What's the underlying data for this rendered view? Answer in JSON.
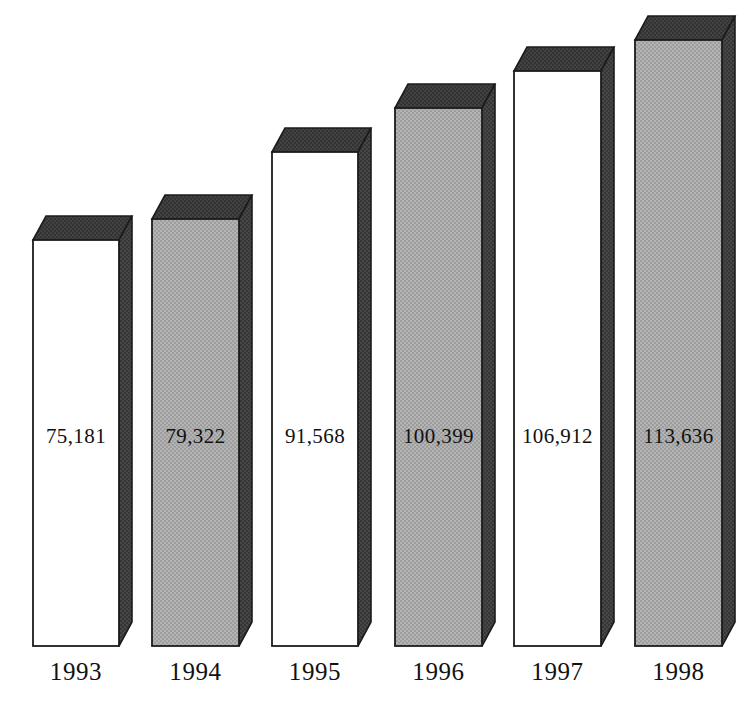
{
  "chart_data": {
    "type": "bar",
    "title": "",
    "subtitle": "",
    "xlabel": "",
    "ylabel": "",
    "categories": [
      "1993",
      "1994",
      "1995",
      "1996",
      "1997",
      "1998"
    ],
    "values": [
      75181,
      79322,
      91568,
      100399,
      106912,
      113636
    ],
    "value_labels": [
      "75,181",
      "79,322",
      "91,568",
      "100,399",
      "106,912",
      "113,636"
    ],
    "series": [
      {
        "name": "",
        "values": [
          75181,
          79322,
          91568,
          100399,
          106912,
          113636
        ]
      }
    ],
    "ylim": [
      0,
      122000
    ],
    "grid": false,
    "legend": false,
    "legend_position": "none",
    "style": "3d-extruded-columns",
    "bar_fills": [
      "white",
      "gray",
      "white",
      "gray",
      "white",
      "gray"
    ],
    "annotations": []
  },
  "colors": {
    "background": "#ffffff",
    "bar_face_white": "#ffffff",
    "bar_face_gray": "#a9a9a9",
    "bar_top_dark": "#3b3b3b",
    "bar_side_dark": "#3f3f3f",
    "outline": "#1c1c1c",
    "text": "#111111"
  },
  "bars": [
    {
      "year": "1993",
      "value_label": "75,181",
      "value": 75181,
      "fill": "white",
      "x": 33,
      "width": 86,
      "top": 240,
      "bottom": 646
    },
    {
      "year": "1994",
      "value_label": "79,322",
      "value": 79322,
      "fill": "gray",
      "x": 152,
      "width": 87,
      "top": 219,
      "bottom": 646
    },
    {
      "year": "1995",
      "value_label": "91,568",
      "value": 91568,
      "fill": "white",
      "x": 272,
      "width": 86,
      "top": 152,
      "bottom": 646
    },
    {
      "year": "1996",
      "value_label": "100,399",
      "value": 100399,
      "fill": "gray",
      "x": 395,
      "width": 87,
      "top": 108,
      "bottom": 646
    },
    {
      "year": "1997",
      "value_label": "106,912",
      "value": 106912,
      "fill": "white",
      "x": 514,
      "width": 87,
      "top": 71,
      "bottom": 646
    },
    {
      "year": "1998",
      "value_label": "113,636",
      "value": 113636,
      "fill": "gray",
      "x": 635,
      "width": 87,
      "top": 40,
      "bottom": 646
    }
  ]
}
